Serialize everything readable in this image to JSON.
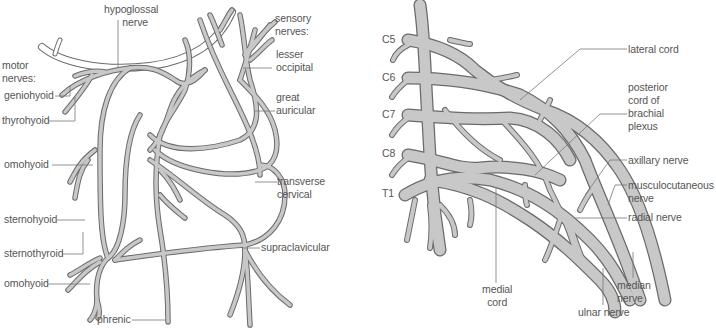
{
  "left_diagram": {
    "title": "cervical plexus",
    "labels": {
      "hypoglossal": [
        "hypoglossal",
        "nerve"
      ],
      "motor": [
        "motor",
        "nerves:"
      ],
      "geniohyoid": "geniohyoid",
      "thyrohyoid": "thyrohyoid",
      "omohyoid_upper": "omohyoid",
      "sternohyoid": "sternohyoid",
      "sternothyroid": "sternothyroid",
      "omohyoid_lower": "omohyoid",
      "phrenic": "phrenic",
      "sensory": [
        "sensory",
        "nerves:"
      ],
      "lesser_occipital": [
        "lesser",
        "occipital"
      ],
      "great_auricular": [
        "great",
        "auricular"
      ],
      "transverse_cervical": [
        "transverse",
        "cervical"
      ],
      "supraclavicular": "supraclavicular"
    }
  },
  "right_diagram": {
    "title": "brachial plexus",
    "roots": [
      "C5",
      "C6",
      "C7",
      "C8",
      "T1"
    ],
    "labels": {
      "lateral_cord": "lateral cord",
      "posterior_cord": [
        "posterior",
        "cord of",
        "brachial",
        "plexus"
      ],
      "axillary": "axillary nerve",
      "musculocutaneous": [
        "musculocutaneous",
        "nerve"
      ],
      "radial": "radial nerve",
      "median": [
        "median",
        "nerve"
      ],
      "ulnar": "ulnar nerve",
      "medial_cord": [
        "medial",
        "cord"
      ]
    }
  },
  "colors": {
    "nerve_fill": "#c8c8c8",
    "nerve_outline": "#6a6a6a",
    "leader_line": "#777777",
    "label_text": "#555555"
  }
}
